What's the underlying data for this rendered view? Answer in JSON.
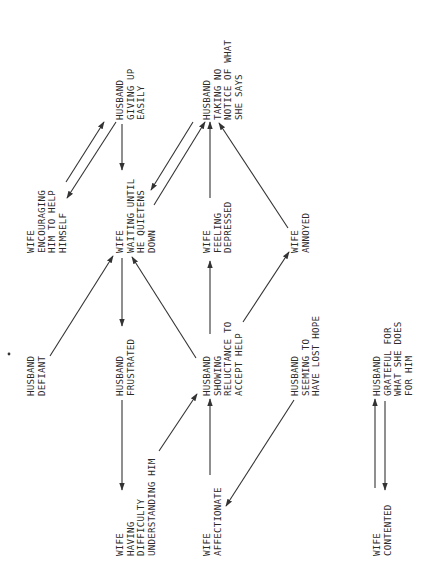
{
  "diagram": {
    "orientation": "rotated-90-ccw",
    "nodes": [
      {
        "id": "h_giving_up",
        "lines": [
          "HUSBAND",
          "GIVING UP",
          "EASILY"
        ],
        "x": 115,
        "y": 120
      },
      {
        "id": "h_taking_no_notice",
        "lines": [
          "HUSBAND",
          "TAKING NO",
          "NOTICE OF WHAT",
          "SHE SAYS"
        ],
        "x": 202,
        "y": 120
      },
      {
        "id": "w_encouraging",
        "lines": [
          "WIFE",
          "ENCOURAGING",
          "HIM TO HELP",
          "HIMSELF"
        ],
        "x": 26,
        "y": 253
      },
      {
        "id": "w_waiting",
        "lines": [
          "WIFE",
          "WAITING UNTIL",
          "HE QUIETENS",
          "DOWN"
        ],
        "x": 115,
        "y": 253
      },
      {
        "id": "w_depressed",
        "lines": [
          "WIFE",
          "FEELING",
          "DEPRESSED"
        ],
        "x": 202,
        "y": 253
      },
      {
        "id": "w_annoyed",
        "lines": [
          "WIFE",
          "ANNOYED"
        ],
        "x": 290,
        "y": 253
      },
      {
        "id": "h_defiant",
        "lines": [
          "HUSBAND",
          "DEFIANT"
        ],
        "x": 26,
        "y": 396
      },
      {
        "id": "h_frustrated",
        "lines": [
          "HUSBAND",
          "FRUSTRATED"
        ],
        "x": 115,
        "y": 396
      },
      {
        "id": "h_reluctance",
        "lines": [
          "HUSBAND",
          "SHOWING",
          "RELUCTANCE TO",
          "ACCEPT HELP"
        ],
        "x": 202,
        "y": 396
      },
      {
        "id": "h_lost_hope",
        "lines": [
          "HUSBAND",
          "SEEMING TO",
          "HAVE LOST HOPE"
        ],
        "x": 290,
        "y": 396
      },
      {
        "id": "h_grateful",
        "lines": [
          "HUSBAND",
          "GRATEFUL FOR",
          "WHAT SHE DOES",
          "FOR HIM"
        ],
        "x": 372,
        "y": 396
      },
      {
        "id": "w_difficulty",
        "lines": [
          "WIFE",
          "HAVING",
          "DIFFICULTY",
          "UNDERSTANDING HIM"
        ],
        "x": 115,
        "y": 556
      },
      {
        "id": "w_affectionate",
        "lines": [
          "WIFE",
          "AFFECTIONATE"
        ],
        "x": 202,
        "y": 556
      },
      {
        "id": "w_contented",
        "lines": [
          "WIFE",
          "CONTENTED"
        ],
        "x": 372,
        "y": 556
      }
    ],
    "edges": [
      {
        "from": "w_encouraging",
        "to": "h_giving_up",
        "x1": 66,
        "y1": 182,
        "x2": 104,
        "y2": 122
      },
      {
        "from": "h_giving_up",
        "to": "w_encouraging",
        "x1": 116,
        "y1": 122,
        "x2": 67,
        "y2": 198
      },
      {
        "from": "h_giving_up",
        "to": "w_waiting",
        "x1": 122,
        "y1": 124,
        "x2": 122,
        "y2": 170
      },
      {
        "from": "h_taking_no_notice",
        "to": "w_waiting",
        "x1": 193,
        "y1": 122,
        "x2": 151,
        "y2": 190
      },
      {
        "from": "w_waiting",
        "to": "h_taking_no_notice",
        "x1": 154,
        "y1": 205,
        "x2": 205,
        "y2": 122
      },
      {
        "from": "w_depressed",
        "to": "h_taking_no_notice",
        "x1": 210,
        "y1": 198,
        "x2": 210,
        "y2": 122
      },
      {
        "from": "w_annoyed",
        "to": "h_taking_no_notice",
        "x1": 288,
        "y1": 228,
        "x2": 219,
        "y2": 123
      },
      {
        "from": "h_defiant",
        "to": "w_waiting",
        "x1": 50,
        "y1": 356,
        "x2": 113,
        "y2": 256
      },
      {
        "from": "w_waiting",
        "to": "h_frustrated",
        "x1": 122,
        "y1": 258,
        "x2": 122,
        "y2": 326
      },
      {
        "from": "h_reluctance",
        "to": "w_waiting",
        "x1": 196,
        "y1": 358,
        "x2": 132,
        "y2": 257
      },
      {
        "from": "h_reluctance",
        "to": "w_depressed",
        "x1": 210,
        "y1": 334,
        "x2": 210,
        "y2": 261
      },
      {
        "from": "h_reluctance",
        "to": "w_annoyed",
        "x1": 243,
        "y1": 322,
        "x2": 289,
        "y2": 252
      },
      {
        "from": "h_frustrated",
        "to": "w_difficulty",
        "x1": 122,
        "y1": 400,
        "x2": 122,
        "y2": 490
      },
      {
        "from": "w_difficulty",
        "to": "h_reluctance",
        "x1": 159,
        "y1": 451,
        "x2": 197,
        "y2": 394
      },
      {
        "from": "w_affectionate",
        "to": "h_reluctance",
        "x1": 210,
        "y1": 475,
        "x2": 210,
        "y2": 399
      },
      {
        "from": "h_lost_hope",
        "to": "w_affectionate",
        "x1": 294,
        "y1": 400,
        "x2": 226,
        "y2": 506
      },
      {
        "from": "w_contented",
        "to": "h_grateful",
        "x1": 375,
        "y1": 488,
        "x2": 375,
        "y2": 399
      },
      {
        "from": "h_grateful",
        "to": "w_contented",
        "x1": 385,
        "y1": 401,
        "x2": 385,
        "y2": 490
      }
    ],
    "stray_dot": {
      "x": 9,
      "y": 354
    }
  },
  "colors": {
    "background": "#ffffff",
    "ink": "#2a2a2a",
    "line": "#333333"
  }
}
